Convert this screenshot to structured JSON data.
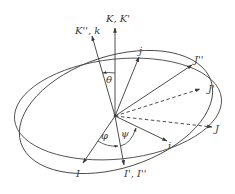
{
  "diagram": {
    "type": "euler-angles-coordinate-frames",
    "vectors": [
      {
        "id": "K",
        "label": "K, K'",
        "style": "solid"
      },
      {
        "id": "Kpp",
        "label": "K'', k",
        "style": "solid"
      },
      {
        "id": "j",
        "label": "j",
        "style": "solid"
      },
      {
        "id": "Jpp",
        "label": "J''",
        "style": "solid"
      },
      {
        "id": "Jp",
        "label": "J'",
        "style": "dashed"
      },
      {
        "id": "J",
        "label": "J",
        "style": "dashed"
      },
      {
        "id": "i",
        "label": "i",
        "style": "solid"
      },
      {
        "id": "I",
        "label": "I",
        "style": "solid"
      },
      {
        "id": "Ip",
        "label": "I', I''",
        "style": "solid"
      }
    ],
    "angles": [
      {
        "id": "theta",
        "label": "θ",
        "between": [
          "K",
          "Kpp"
        ]
      },
      {
        "id": "phi",
        "label": "φ",
        "between": [
          "I",
          "Ip"
        ]
      },
      {
        "id": "psi",
        "label": "ψ",
        "between": [
          "Ip",
          "i"
        ]
      }
    ],
    "planes": [
      {
        "id": "reference-plane",
        "shape": "ellipse"
      },
      {
        "id": "rotated-plane",
        "shape": "ellipse"
      }
    ],
    "colors": {
      "line": "#3a3a3a",
      "background": "#ffffff"
    }
  }
}
